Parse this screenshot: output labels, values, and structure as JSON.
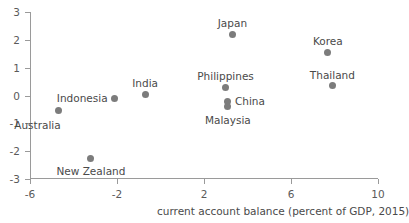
{
  "chart_data": {
    "type": "scatter",
    "title": "",
    "xlabel": "current account balance (percent of GDP, 2015)",
    "ylabel": "",
    "xlim": [
      -6,
      10
    ],
    "ylim": [
      -3,
      3
    ],
    "xticks": [
      -6,
      -2,
      2,
      6,
      10
    ],
    "yticks": [
      -3,
      -2,
      -1,
      0,
      1,
      2,
      3
    ],
    "xtick_labels": [
      "-6",
      "-2",
      "2",
      "6",
      "10"
    ],
    "ytick_labels": [
      "-3",
      "-2",
      "-1",
      "0",
      "1",
      "2",
      "3"
    ],
    "grid": false,
    "legend": null,
    "marker_color": "#7c7c7c",
    "axis_color": "#9a9a9a",
    "points": [
      {
        "label": "Australia",
        "x": -4.7,
        "y": -0.55,
        "label_pos": "below-left"
      },
      {
        "label": "Indonesia",
        "x": -2.1,
        "y": -0.1,
        "label_pos": "left"
      },
      {
        "label": "New Zealand",
        "x": -3.2,
        "y": -2.25,
        "label_pos": "below"
      },
      {
        "label": "India",
        "x": -0.7,
        "y": 0.05,
        "label_pos": "above"
      },
      {
        "label": "Philippines",
        "x": 3.0,
        "y": 0.3,
        "label_pos": "above"
      },
      {
        "label": "Japan",
        "x": 3.3,
        "y": 2.2,
        "label_pos": "above"
      },
      {
        "label": "China",
        "x": 3.1,
        "y": -0.2,
        "label_pos": "right"
      },
      {
        "label": "Malaysia",
        "x": 3.1,
        "y": -0.4,
        "label_pos": "below"
      },
      {
        "label": "Korea",
        "x": 7.7,
        "y": 1.55,
        "label_pos": "above"
      },
      {
        "label": "Thailand",
        "x": 7.9,
        "y": 0.35,
        "label_pos": "above"
      }
    ]
  }
}
